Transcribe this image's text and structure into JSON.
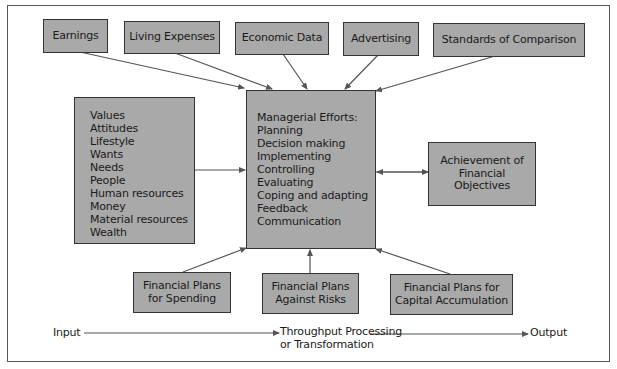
{
  "diagram": {
    "top_inputs": [
      {
        "label": "Earnings"
      },
      {
        "label": "Living Expenses"
      },
      {
        "label": "Economic Data"
      },
      {
        "label": "Advertising"
      },
      {
        "label": "Standards of Comparison"
      }
    ],
    "resources": {
      "items": [
        "Values",
        "Attitudes",
        "Lifestyle",
        "Wants",
        "Needs",
        "People",
        "Human resources",
        "Money",
        "Material resources",
        "Wealth"
      ]
    },
    "center": {
      "title": "Managerial Efforts:",
      "items": [
        "Planning",
        "Decision making",
        "Implementing",
        "Controlling",
        "Evaluating",
        "Coping and adapting",
        "Feedback",
        "Communication"
      ]
    },
    "output_box": {
      "lines": [
        "Achievement of",
        "Financial",
        "Objectives"
      ]
    },
    "bottom_plans": [
      {
        "lines": [
          "Financial Plans",
          "for Spending"
        ]
      },
      {
        "lines": [
          "Financial Plans",
          "Against Risks"
        ]
      },
      {
        "lines": [
          "Financial Plans for",
          "Capital Accumulation"
        ]
      }
    ],
    "flow": {
      "input": "Input",
      "throughput_line1": "Throughput Processing",
      "throughput_line2": "or Transformation",
      "output": "Output"
    },
    "colors": {
      "box_fill": "#a9a9a9",
      "border": "#333333",
      "arrow": "#555555"
    }
  }
}
